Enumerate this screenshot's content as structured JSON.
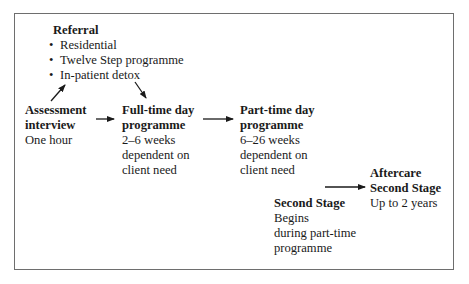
{
  "diagram": {
    "referral": {
      "title": "Referral",
      "items": [
        "Residential",
        "Twelve Step programme",
        "In-patient detox"
      ]
    },
    "assessment": {
      "title_lines": [
        "Assessment",
        "interview"
      ],
      "detail_lines": [
        "One hour"
      ]
    },
    "full_time": {
      "title_lines": [
        "Full-time day",
        "programme"
      ],
      "detail_lines": [
        "2–6 weeks",
        "dependent on",
        "client need"
      ]
    },
    "part_time": {
      "title_lines": [
        "Part-time day",
        "programme"
      ],
      "detail_lines": [
        "6–26 weeks",
        "dependent on",
        "client need"
      ]
    },
    "aftercare": {
      "title_lines": [
        "Aftercare",
        "Second Stage"
      ],
      "detail_lines": [
        "Up to 2 years"
      ]
    },
    "second_stage": {
      "title_lines": [
        "Second Stage"
      ],
      "detail_lines": [
        "Begins",
        "during part-time",
        "programme"
      ]
    },
    "bullet_glyph": "•",
    "edges": [
      {
        "from": "assessment",
        "to": "referral"
      },
      {
        "from": "referral",
        "to": "full_time"
      },
      {
        "from": "assessment",
        "to": "full_time"
      },
      {
        "from": "full_time",
        "to": "part_time"
      },
      {
        "from": "second_stage",
        "to": "aftercare"
      }
    ]
  }
}
